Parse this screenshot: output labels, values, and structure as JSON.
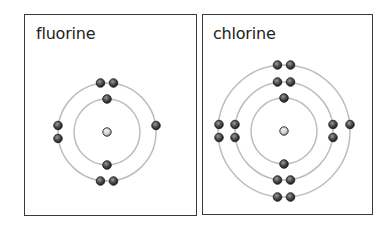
{
  "panels": [
    {
      "label": "fluorine",
      "element": "fluorine",
      "shells": [
        2,
        7
      ],
      "center": [
        107,
        132
      ],
      "radii": [
        33,
        49
      ],
      "box": {
        "left": 24,
        "top": 14,
        "right": 196,
        "bottom": 215
      }
    },
    {
      "label": "chlorine",
      "element": "chlorine",
      "shells": [
        2,
        8,
        7
      ],
      "center": [
        284,
        131
      ],
      "radii": [
        33,
        49,
        66
      ],
      "box": {
        "left": 202,
        "top": 14,
        "right": 372,
        "bottom": 214
      }
    }
  ],
  "colors": {
    "border": "#3a3a3a",
    "shell": "#bdbdbd",
    "electron_dark": "#2a2a2a",
    "electron_light": "#8a8a8a",
    "nucleus_light": "#e6e6e6",
    "nucleus_dark": "#9a9a9a"
  }
}
